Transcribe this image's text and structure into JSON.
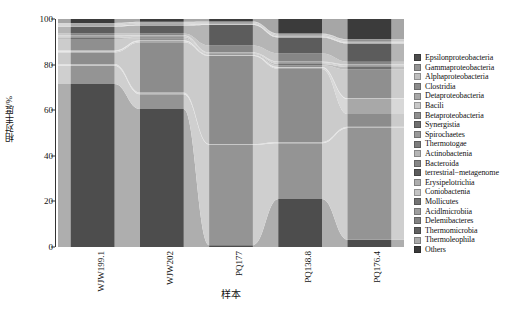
{
  "chart_data": {
    "type": "area",
    "title": "",
    "subtitle": "",
    "xlabel": "样本",
    "ylabel": "相对丰度/%",
    "ylim": [
      0,
      100
    ],
    "yticks": [
      0,
      20,
      40,
      60,
      80,
      100
    ],
    "ytick_labels": [
      "0",
      "20",
      "40",
      "60",
      "80",
      "100"
    ],
    "grid": false,
    "legend_position": "right",
    "stacked": true,
    "normalized_percent": true,
    "categories": [
      "WJW199.1",
      "WJW202",
      "PQ177",
      "PQ138.8",
      "PQ176.4"
    ],
    "series": [
      {
        "name": "Epsilonproteobacteria",
        "color": "#4d4d4d",
        "values": [
          71.5,
          60.5,
          0.8,
          21.0,
          3.2
        ]
      },
      {
        "name": "Gammaproteobacteria",
        "color": "#949494",
        "values": [
          8.0,
          6.5,
          44.0,
          24.5,
          49.0
        ]
      },
      {
        "name": "Alphaproteobacteria",
        "color": "#bfbfbf",
        "values": [
          0.8,
          0.8,
          0.3,
          0.6,
          0.5
        ]
      },
      {
        "name": "Clostridia",
        "color": "#8c8c8c",
        "values": [
          5.0,
          22.0,
          38.5,
          32.0,
          5.6
        ]
      },
      {
        "name": "Detaproteobacteria",
        "color": "#a8a8a8",
        "values": [
          0.5,
          0.5,
          0.2,
          0.5,
          6.6
        ]
      },
      {
        "name": "Bacili",
        "color": "#c9c9c9",
        "values": [
          0.4,
          0.4,
          0.2,
          0.4,
          0.4
        ]
      },
      {
        "name": "Betaproteobacteria",
        "color": "#8f8f8f",
        "values": [
          5.0,
          0.9,
          0.3,
          0.7,
          12.5
        ]
      },
      {
        "name": "Synergistia",
        "color": "#6f6f6f",
        "values": [
          0.5,
          0.4,
          0.3,
          0.6,
          1.2
        ]
      },
      {
        "name": "Spirochaetes",
        "color": "#999999",
        "values": [
          0.4,
          0.3,
          0.2,
          0.4,
          0.4
        ]
      },
      {
        "name": "Thermotogae",
        "color": "#7d7d7d",
        "values": [
          0.3,
          0.3,
          0.2,
          0.3,
          0.3
        ]
      },
      {
        "name": "Actinobactenia",
        "color": "#b5b5b5",
        "values": [
          0.4,
          0.3,
          0.2,
          0.4,
          0.4
        ]
      },
      {
        "name": "Bacteroida",
        "color": "#868686",
        "values": [
          0.8,
          0.7,
          3.0,
          3.5,
          1.2
        ]
      },
      {
        "name": "terrestrial−metagenome",
        "color": "#5c5c5c",
        "values": [
          3.0,
          3.5,
          9.0,
          7.0,
          8.0
        ]
      },
      {
        "name": "Erysipelotrichia",
        "color": "#adadad",
        "values": [
          0.3,
          0.3,
          0.2,
          0.3,
          0.3
        ]
      },
      {
        "name": "Coniobactenia",
        "color": "#c4c4c4",
        "values": [
          0.2,
          0.2,
          0.2,
          0.2,
          0.2
        ]
      },
      {
        "name": "Mollicutes",
        "color": "#737373",
        "values": [
          0.3,
          0.3,
          0.2,
          0.3,
          0.3
        ]
      },
      {
        "name": "Acidlmicrobiia",
        "color": "#9e9e9e",
        "values": [
          0.2,
          0.2,
          0.2,
          0.2,
          0.2
        ]
      },
      {
        "name": "Delemibacteres",
        "color": "#828282",
        "values": [
          0.2,
          0.2,
          0.2,
          0.2,
          0.3
        ]
      },
      {
        "name": "Thermomicrobia",
        "color": "#616161",
        "values": [
          0.2,
          0.2,
          0.2,
          0.2,
          0.2
        ]
      },
      {
        "name": "Thermoleophila",
        "color": "#aaaaaa",
        "values": [
          0.3,
          0.3,
          0.3,
          0.3,
          0.3
        ]
      },
      {
        "name": "Others",
        "color": "#3b3b3b",
        "values": [
          1.7,
          1.2,
          1.1,
          6.4,
          8.9
        ]
      }
    ]
  },
  "axes": {
    "y_title": "相对丰度/%",
    "x_title": "样本",
    "ytick_labels": [
      "100",
      "80",
      "60",
      "40",
      "20",
      "0"
    ],
    "xtick_labels": [
      "WJW199.1",
      "WJW202",
      "PQ177",
      "PQ138.8",
      "PQ176.4"
    ]
  },
  "legend": {
    "items": [
      {
        "label": "Epsilonproteobacteria",
        "color": "#4d4d4d"
      },
      {
        "label": "Gammaproteobacteria",
        "color": "#949494"
      },
      {
        "label": "Alphaproteobacteria",
        "color": "#bfbfbf"
      },
      {
        "label": "Clostridia",
        "color": "#8c8c8c"
      },
      {
        "label": "Detaproteobacteria",
        "color": "#a8a8a8"
      },
      {
        "label": "Bacili",
        "color": "#c9c9c9"
      },
      {
        "label": "Betaproteobacteria",
        "color": "#8f8f8f"
      },
      {
        "label": "Synergistia",
        "color": "#6f6f6f"
      },
      {
        "label": "Spirochaetes",
        "color": "#999999"
      },
      {
        "label": "Thermotogae",
        "color": "#7d7d7d"
      },
      {
        "label": "Actinobactenia",
        "color": "#b5b5b5"
      },
      {
        "label": "Bacteroida",
        "color": "#868686"
      },
      {
        "label": "terrestrial−metagenome",
        "color": "#5c5c5c"
      },
      {
        "label": "Erysipelotrichia",
        "color": "#adadad"
      },
      {
        "label": "Coniobactenia",
        "color": "#c4c4c4"
      },
      {
        "label": "Mollicutes",
        "color": "#737373"
      },
      {
        "label": "Acidlmicrobiia",
        "color": "#9e9e9e"
      },
      {
        "label": "Delemibacteres",
        "color": "#828282"
      },
      {
        "label": "Thermomicrobia",
        "color": "#616161"
      },
      {
        "label": "Thermoleophila",
        "color": "#aaaaaa"
      },
      {
        "label": "Others",
        "color": "#3b3b3b"
      }
    ]
  }
}
